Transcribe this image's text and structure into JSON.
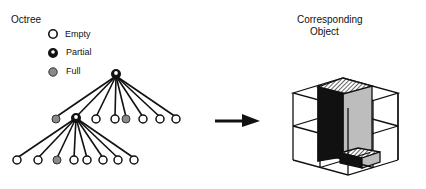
{
  "left_panel": {
    "title": "Octree",
    "legend": [
      {
        "label": "Empty",
        "icon": "empty-node-icon"
      },
      {
        "label": "Partial",
        "icon": "partial-node-icon"
      },
      {
        "label": "Full",
        "icon": "full-node-icon"
      }
    ],
    "tree": {
      "root": "partial",
      "level1": [
        "full",
        "partial",
        "empty",
        "empty",
        "full",
        "empty",
        "empty",
        "empty"
      ],
      "level2": [
        "empty",
        "empty",
        "full",
        "empty",
        "empty",
        "empty",
        "empty",
        "empty"
      ]
    }
  },
  "arrow": {
    "icon": "right-arrow-icon"
  },
  "right_panel": {
    "title_line1": "Corresponding",
    "title_line2": "Object"
  },
  "colors": {
    "line": "#111111",
    "full": "#8a8a8a",
    "empty": "#ffffff",
    "dark_block": "#111111",
    "light_block": "#bdbdbd"
  }
}
